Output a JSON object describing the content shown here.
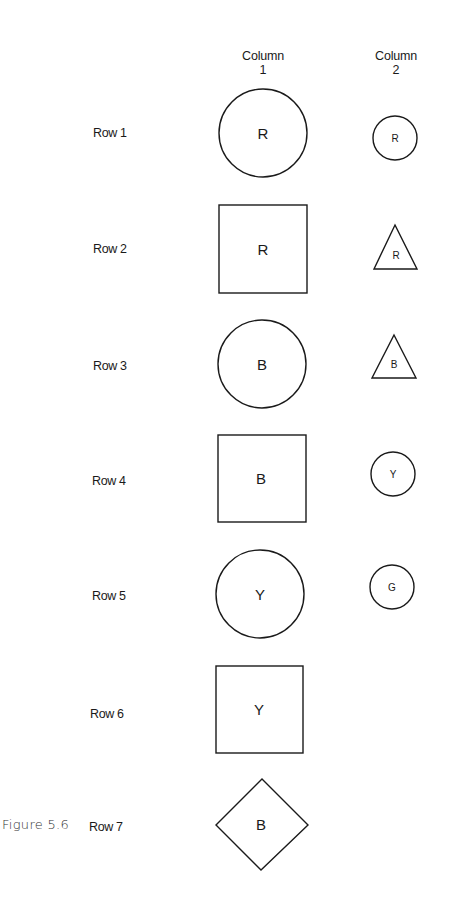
{
  "figure": {
    "caption": "Figure 5.6",
    "columns": [
      {
        "line1": "Column",
        "line2": "1"
      },
      {
        "line1": "Column",
        "line2": "2"
      }
    ],
    "rows": [
      {
        "label": "Row 1",
        "col1": {
          "shape": "circle",
          "letter": "R"
        },
        "col2": {
          "shape": "circle",
          "letter": "R"
        }
      },
      {
        "label": "Row 2",
        "col1": {
          "shape": "square",
          "letter": "R"
        },
        "col2": {
          "shape": "triangle",
          "letter": "R"
        }
      },
      {
        "label": "Row 3",
        "col1": {
          "shape": "circle",
          "letter": "B"
        },
        "col2": {
          "shape": "triangle",
          "letter": "B"
        }
      },
      {
        "label": "Row 4",
        "col1": {
          "shape": "square",
          "letter": "B"
        },
        "col2": {
          "shape": "circle",
          "letter": "Y"
        }
      },
      {
        "label": "Row 5",
        "col1": {
          "shape": "circle",
          "letter": "Y"
        },
        "col2": {
          "shape": "circle",
          "letter": "G"
        }
      },
      {
        "label": "Row 6",
        "col1": {
          "shape": "square",
          "letter": "Y"
        },
        "col2": null
      },
      {
        "label": "Row 7",
        "col1": {
          "shape": "diamond",
          "letter": "B"
        },
        "col2": null
      }
    ]
  },
  "colors": {
    "stroke": "#1a1a1a",
    "background": "#ffffff"
  }
}
